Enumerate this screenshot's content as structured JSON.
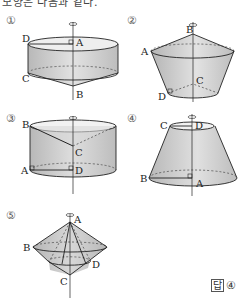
{
  "header": {
    "text": "모양은 다음과 같다."
  },
  "figures": [
    {
      "number": "①",
      "labels": {
        "A": "A",
        "B": "B",
        "C": "C",
        "D": "D"
      },
      "shape": "cylinder-with-cone-below"
    },
    {
      "number": "②",
      "labels": {
        "A": "A",
        "B": "B",
        "C": "C",
        "D": "D"
      },
      "shape": "cone-on-frustum-hollow"
    },
    {
      "number": "③",
      "labels": {
        "A": "A",
        "B": "B",
        "C": "C",
        "D": "D"
      },
      "shape": "cylinder-with-cone-hole"
    },
    {
      "number": "④",
      "labels": {
        "A": "A",
        "B": "B",
        "C": "C",
        "D": "D"
      },
      "shape": "frustum"
    },
    {
      "number": "⑤",
      "labels": {
        "A": "A",
        "B": "B",
        "C": "C",
        "D": "D"
      },
      "shape": "double-cone-combination"
    }
  ],
  "answer": {
    "label": "답",
    "value": "④"
  },
  "colors": {
    "fill": "#c8c8c8",
    "fill_light": "#e6e6e6",
    "stroke": "#222222"
  }
}
